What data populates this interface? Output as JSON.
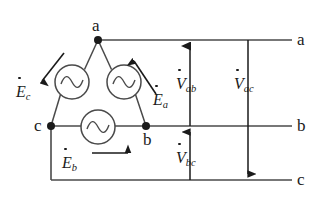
{
  "figure": {
    "type": "circuit-diagram",
    "stroke_color": "#3a3a3a",
    "text_color": "#1a1a1a",
    "background": "#ffffff"
  },
  "nodes": [
    {
      "id": "a",
      "label": "a",
      "x": 98,
      "y": 40
    },
    {
      "id": "c",
      "label": "c",
      "x": 51,
      "y": 126
    },
    {
      "id": "b",
      "label": "b",
      "x": 146,
      "y": 126
    }
  ],
  "terminals": [
    {
      "id": "a",
      "label": "a",
      "x": 300,
      "y": 40
    },
    {
      "id": "b",
      "label": "b",
      "x": 300,
      "y": 126
    },
    {
      "id": "c",
      "label": "c",
      "x": 300,
      "y": 180
    }
  ],
  "sources": [
    {
      "id": "Ec",
      "symbol": "~",
      "cx": 72,
      "cy": 82,
      "r": 17
    },
    {
      "id": "Ea",
      "symbol": "~",
      "cx": 124,
      "cy": 82,
      "r": 17
    },
    {
      "id": "Eb",
      "symbol": "~",
      "cx": 98,
      "cy": 127,
      "r": 17
    }
  ],
  "emf_labels": [
    {
      "id": "Ec",
      "letter": "E",
      "sub": "c",
      "dot": true,
      "x": 15,
      "y": 88,
      "arrow_direction": "down-left"
    },
    {
      "id": "Ea",
      "letter": "E",
      "sub": "a",
      "dot": true,
      "x": 152,
      "y": 95,
      "arrow_direction": "up-right"
    },
    {
      "id": "Eb",
      "letter": "E",
      "sub": "b",
      "dot": true,
      "x": 61,
      "y": 148,
      "arrow_direction": "right"
    }
  ],
  "voltage_labels": [
    {
      "id": "Vab",
      "letter": "V",
      "sub": "ab",
      "dot": true,
      "x": 175,
      "y": 78,
      "arrow_direction": "up",
      "line_x": 190,
      "from_y": 126,
      "to_y": 40
    },
    {
      "id": "Vbc",
      "letter": "V",
      "sub": "bc",
      "dot": true,
      "x": 175,
      "y": 152,
      "arrow_direction": "up",
      "line_x": 190,
      "from_y": 180,
      "to_y": 126
    },
    {
      "id": "Vac",
      "letter": "V",
      "sub": "ac",
      "dot": true,
      "x": 235,
      "y": 78,
      "arrow_direction": "down",
      "line_x": 248,
      "from_y": 40,
      "to_y": 180
    }
  ]
}
